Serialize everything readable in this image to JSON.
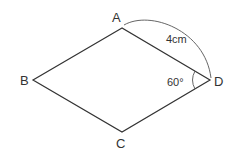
{
  "diagram": {
    "shape": "rhombus",
    "vertices": {
      "A": {
        "label": "A",
        "x": 122,
        "y": 28
      },
      "B": {
        "label": "B",
        "x": 33,
        "y": 80
      },
      "C": {
        "label": "C",
        "x": 122,
        "y": 132
      },
      "D": {
        "label": "D",
        "x": 210,
        "y": 80
      }
    },
    "side_label": "4cm",
    "angle_label": "60°",
    "colors": {
      "stroke": "#333333",
      "background": "#ffffff"
    }
  }
}
